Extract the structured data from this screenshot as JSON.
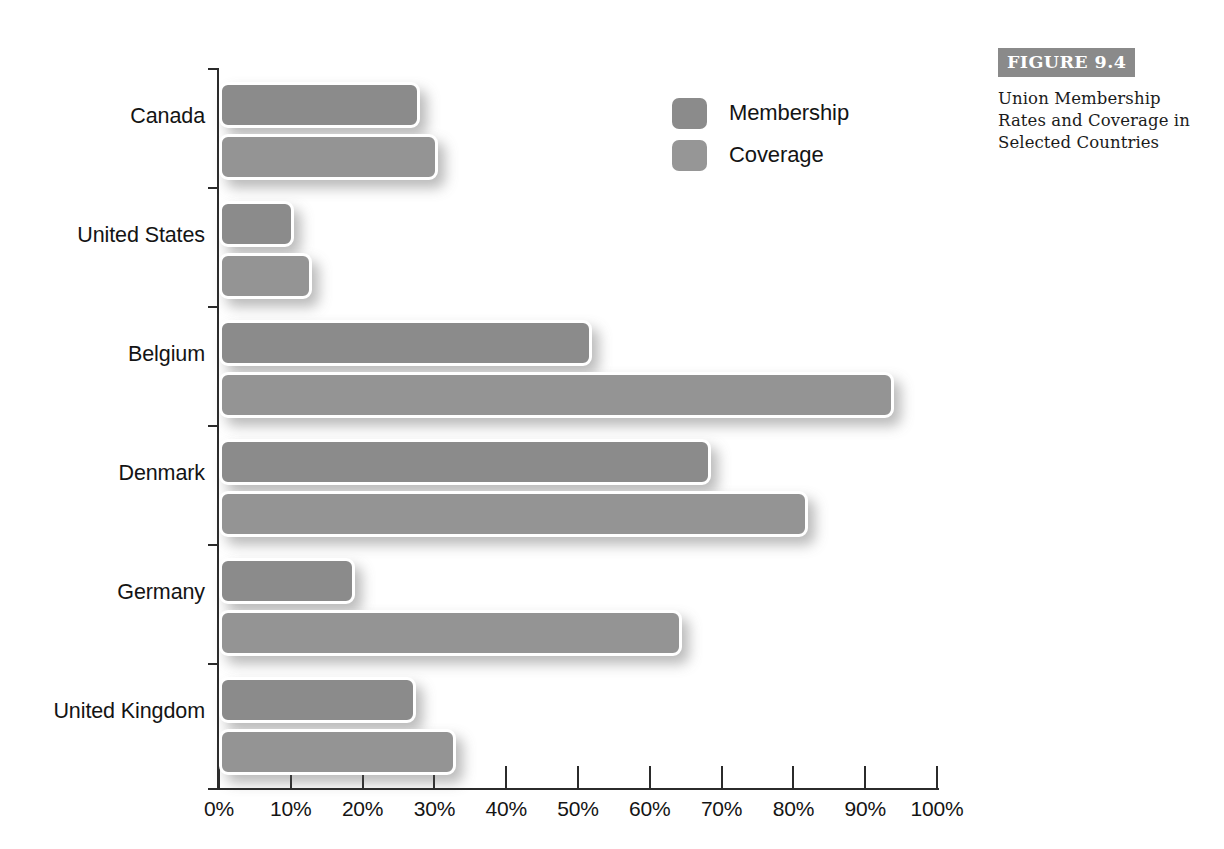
{
  "figure": {
    "banner_label": "FIGURE 9.4",
    "caption": "Union Membership Rates and Coverage in Selected Countries"
  },
  "legend": {
    "position": "top-center-right",
    "items": [
      {
        "label": "Membership",
        "color": "#8b8b8b"
      },
      {
        "label": "Coverage",
        "color": "#969696"
      }
    ]
  },
  "axis": {
    "x_tick_labels": [
      "0%",
      "10%",
      "20%",
      "30%",
      "40%",
      "50%",
      "60%",
      "70%",
      "80%",
      "90%",
      "100%"
    ]
  },
  "chart_data": {
    "type": "bar",
    "orientation": "horizontal",
    "title": "Union Membership Rates and Coverage in Selected Countries",
    "xlabel": "",
    "ylabel": "",
    "xlim": [
      0,
      100
    ],
    "xticks": [
      0,
      10,
      20,
      30,
      40,
      50,
      60,
      70,
      80,
      90,
      100
    ],
    "xtick_labels": [
      "0%",
      "10%",
      "20%",
      "30%",
      "40%",
      "50%",
      "60%",
      "70%",
      "80%",
      "90%",
      "100%"
    ],
    "grid": false,
    "legend": [
      "Membership",
      "Coverage"
    ],
    "legend_position": "upper right inside",
    "categories": [
      "Canada",
      "United States",
      "Belgium",
      "Denmark",
      "Germany",
      "United Kingdom"
    ],
    "series": [
      {
        "name": "Membership",
        "color": "#8b8b8b",
        "values": [
          28,
          10.5,
          52,
          68.5,
          19,
          27.5
        ]
      },
      {
        "name": "Coverage",
        "color": "#969696",
        "values": [
          30.5,
          13,
          94,
          82,
          64.5,
          33
        ]
      }
    ]
  },
  "bars": [
    {
      "category": "Canada",
      "series": "Membership",
      "value": 28,
      "top": 82,
      "label_top": 118
    },
    {
      "category": "Canada",
      "series": "Coverage",
      "value": 30.5,
      "top": 134,
      "label_top": 118
    },
    {
      "category": "United States",
      "series": "Membership",
      "value": 10.5,
      "top": 201,
      "label_top": 237
    },
    {
      "category": "United States",
      "series": "Coverage",
      "value": 13,
      "top": 253,
      "label_top": 237
    },
    {
      "category": "Belgium",
      "series": "Membership",
      "value": 52,
      "top": 320,
      "label_top": 356
    },
    {
      "category": "Belgium",
      "series": "Coverage",
      "value": 94,
      "top": 372,
      "label_top": 356
    },
    {
      "category": "Denmark",
      "series": "Membership",
      "value": 68.5,
      "top": 439,
      "label_top": 475
    },
    {
      "category": "Denmark",
      "series": "Coverage",
      "value": 82,
      "top": 491,
      "label_top": 475
    },
    {
      "category": "Germany",
      "series": "Membership",
      "value": 19,
      "top": 558,
      "label_top": 594
    },
    {
      "category": "Germany",
      "series": "Coverage",
      "value": 64.5,
      "top": 610,
      "label_top": 594
    },
    {
      "category": "United Kingdom",
      "series": "Membership",
      "value": 27.5,
      "top": 677,
      "label_top": 713
    },
    {
      "category": "United Kingdom",
      "series": "Coverage",
      "value": 33,
      "top": 729,
      "label_top": 713
    }
  ],
  "category_ticks": [
    68,
    187,
    306,
    425,
    544,
    663,
    788
  ],
  "geometry": {
    "x0_px": 219,
    "px_per_percent": 7.18
  }
}
